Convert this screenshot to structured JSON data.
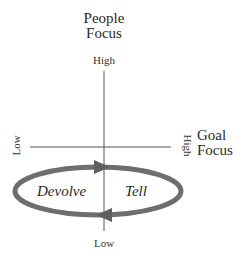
{
  "diagram": {
    "type": "two-axis quadrant with cycle",
    "y_axis": {
      "title_line1": "People",
      "title_line2": "Focus",
      "high_label": "High",
      "low_label": "Low"
    },
    "x_axis": {
      "title_line1": "Goal",
      "title_line2": "Focus",
      "high_label": "High",
      "low_label": "Low"
    },
    "cycle": {
      "direction": "clockwise",
      "left_label": "Devolve",
      "right_label": "Tell",
      "color": "#6e6e6e"
    },
    "colors": {
      "axis": "#555555",
      "text": "#2a2a2a",
      "background": "#ffffff"
    }
  }
}
